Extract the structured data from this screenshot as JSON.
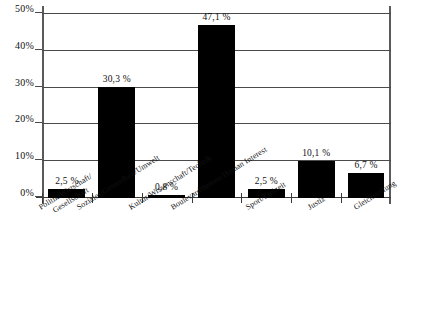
{
  "chart_data": {
    "type": "bar",
    "title": "",
    "subtitle": "",
    "xlabel": "",
    "ylabel": "",
    "ylim": [
      0,
      50
    ],
    "grid": true,
    "legend": null,
    "orientation": "vertical",
    "bar_color": "#000000",
    "categories": [
      "Politik/Wirtschaft/ Gesellschaft",
      "Soziales/Gesundheit/Umwelt",
      "Kultur/Wissenschaft/Technik",
      "Boulevardthemen/Human Interest",
      "Sport/Freizeit",
      "Justiz",
      "Gleichstellung"
    ],
    "category_lines": [
      [
        "Politik/Wirtschaft/",
        "Gesellschaft"
      ],
      [
        "Soziales/Gesundheit/Umwelt",
        ""
      ],
      [
        "Kultur/Wissenschaft/Technik",
        ""
      ],
      [
        "Boulevardthemen/Human Interest",
        ""
      ],
      [
        "Sport/Freizeit",
        ""
      ],
      [
        "Justiz",
        ""
      ],
      [
        "Gleichstellung",
        ""
      ]
    ],
    "values": [
      2.5,
      30.3,
      0.8,
      47.1,
      2.5,
      10.1,
      6.7
    ],
    "value_labels": [
      "2,5 %",
      "30,3 %",
      "0,8 %",
      "47,1 %",
      "2,5 %",
      "10,1 %",
      "6,7 %"
    ],
    "y_ticks": [
      0,
      10,
      20,
      30,
      40,
      50
    ],
    "y_tick_labels": [
      "0%",
      "10%",
      "20%",
      "30%",
      "40%",
      "50%"
    ]
  },
  "footnote": ""
}
